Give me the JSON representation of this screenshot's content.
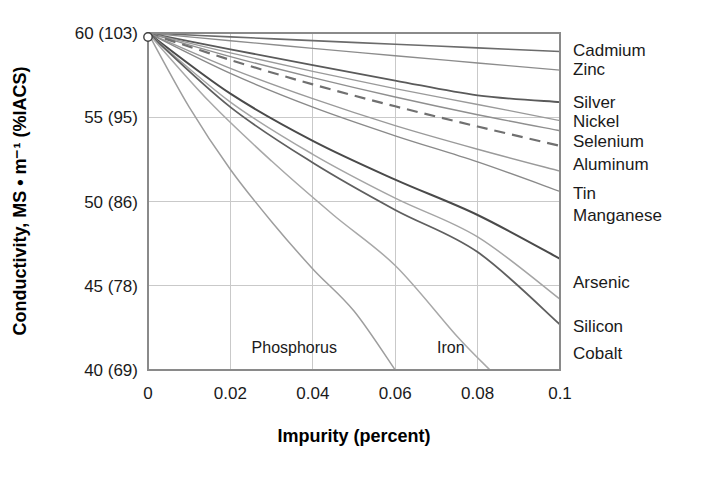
{
  "chart_data": {
    "type": "line",
    "title": "",
    "xlabel": "Impurity (percent)",
    "ylabel": "Conductivity, MS • m⁻¹ (%IACS)",
    "xlim": [
      0,
      0.1
    ],
    "ylim": [
      40,
      60
    ],
    "grid": true,
    "legend_position": "right-of-plot (inline end-of-line labels)",
    "x_ticks": [
      {
        "value": 0,
        "label": "0"
      },
      {
        "value": 0.02,
        "label": "0.02"
      },
      {
        "value": 0.04,
        "label": "0.04"
      },
      {
        "value": 0.06,
        "label": "0.06"
      },
      {
        "value": 0.08,
        "label": "0.08"
      },
      {
        "value": 0.1,
        "label": "0.1"
      }
    ],
    "y_ticks": [
      {
        "value": 60,
        "label": "60 (103)"
      },
      {
        "value": 55,
        "label": "55 (95)"
      },
      {
        "value": 50,
        "label": "50 (86)"
      },
      {
        "value": 45,
        "label": "45 (78)"
      },
      {
        "value": 40,
        "label": "40 (69)"
      }
    ],
    "origin_marker": {
      "x": 0,
      "y": 60
    },
    "annotations": [
      {
        "text": "Phosphorus",
        "x": 0.0355,
        "y": 41.0
      },
      {
        "text": "Iron",
        "x": 0.0735,
        "y": 41.0
      }
    ],
    "series": [
      {
        "name": "Cadmium",
        "label": "Cadmium",
        "color": "#6b6b6b",
        "width": 1.6,
        "dashed": false,
        "x": [
          0,
          0.02,
          0.04,
          0.06,
          0.08,
          0.1
        ],
        "values": [
          60,
          59.77,
          59.55,
          59.33,
          59.12,
          58.9
        ]
      },
      {
        "name": "Zinc",
        "label": "Zinc",
        "color": "#8c8c8c",
        "width": 1.3,
        "dashed": false,
        "x": [
          0,
          0.02,
          0.04,
          0.06,
          0.08,
          0.1
        ],
        "values": [
          60,
          59.54,
          59.09,
          58.65,
          58.22,
          57.8
        ]
      },
      {
        "name": "Silver",
        "label": "Silver",
        "color": "#5a5a5a",
        "width": 1.8,
        "dashed": false,
        "x": [
          0,
          0.02,
          0.04,
          0.06,
          0.08,
          0.1
        ],
        "values": [
          60,
          59.03,
          58.09,
          57.18,
          56.3,
          55.9
        ]
      },
      {
        "name": "Nickel",
        "label": "Nickel",
        "color": "#9a9a9a",
        "width": 1.4,
        "dashed": false,
        "x": [
          0,
          0.02,
          0.04,
          0.06,
          0.08,
          0.1
        ],
        "values": [
          60,
          58.82,
          57.72,
          56.7,
          55.76,
          54.8
        ]
      },
      {
        "name": "Selenium",
        "label": "Selenium",
        "color": "#8f8f8f",
        "width": 1.4,
        "dashed": false,
        "x": [
          0,
          0.02,
          0.04,
          0.06,
          0.08,
          0.1
        ],
        "values": [
          60,
          58.6,
          57.35,
          56.2,
          55.15,
          54.2
        ]
      },
      {
        "name": "Aluminum",
        "label": "Aluminum",
        "color": "#707070",
        "width": 2.2,
        "dashed": true,
        "x": [
          0,
          0.02,
          0.04,
          0.06,
          0.08,
          0.1
        ],
        "values": [
          60,
          58.4,
          56.95,
          55.65,
          54.45,
          53.3
        ]
      },
      {
        "name": "Tin",
        "label": "Tin",
        "color": "#9a9a9a",
        "width": 1.4,
        "dashed": false,
        "x": [
          0,
          0.02,
          0.04,
          0.06,
          0.08,
          0.1
        ],
        "values": [
          60,
          57.9,
          56.1,
          54.5,
          53.1,
          51.8
        ]
      },
      {
        "name": "Manganese",
        "label": "Manganese",
        "color": "#8a8a8a",
        "width": 1.4,
        "dashed": false,
        "x": [
          0,
          0.02,
          0.04,
          0.06,
          0.08,
          0.1
        ],
        "values": [
          60,
          57.6,
          55.6,
          53.9,
          52.35,
          50.6
        ]
      },
      {
        "name": "Arsenic",
        "label": "Arsenic",
        "color": "#4a4a4a",
        "width": 2.0,
        "dashed": false,
        "x": [
          0,
          0.02,
          0.04,
          0.06,
          0.08,
          0.1
        ],
        "values": [
          60,
          56.4,
          53.6,
          51.3,
          49.2,
          46.6
        ]
      },
      {
        "name": "Silicon",
        "label": "Silicon",
        "color": "#a5a5a5",
        "width": 1.5,
        "dashed": false,
        "x": [
          0,
          0.02,
          0.04,
          0.06,
          0.08,
          0.1
        ],
        "values": [
          60,
          55.9,
          52.8,
          50.2,
          47.9,
          44.2
        ]
      },
      {
        "name": "Cobalt",
        "label": "Cobalt",
        "color": "#5f5f5f",
        "width": 1.8,
        "dashed": false,
        "x": [
          0,
          0.02,
          0.04,
          0.06,
          0.08,
          0.1
        ],
        "values": [
          60,
          55.6,
          52.3,
          49.5,
          47.0,
          42.7
        ]
      },
      {
        "name": "Phosphorus",
        "label": "Phosphorus",
        "color": "#9e9e9e",
        "width": 1.5,
        "dashed": false,
        "x": [
          0,
          0.01,
          0.02,
          0.03,
          0.04,
          0.05,
          0.06
        ],
        "values": [
          60,
          55.6,
          51.9,
          48.8,
          46.0,
          43.5,
          40.0
        ]
      },
      {
        "name": "Iron",
        "label": "Iron",
        "color": "#a8a8a8",
        "width": 1.5,
        "dashed": false,
        "x": [
          0,
          0.015,
          0.03,
          0.045,
          0.06,
          0.075,
          0.083
        ],
        "values": [
          60,
          55.9,
          52.4,
          49.2,
          46.2,
          42.0,
          40.0
        ]
      }
    ],
    "right_labels": [
      {
        "text": "Cadmium",
        "y": 59.0
      },
      {
        "text": "Zinc",
        "y": 57.85
      },
      {
        "text": "Silver",
        "y": 55.9
      },
      {
        "text": "Nickel",
        "y": 54.75
      },
      {
        "text": "Selenium",
        "y": 53.6
      },
      {
        "text": "Aluminum",
        "y": 52.2
      },
      {
        "text": "Tin",
        "y": 50.5
      },
      {
        "text": "Manganese",
        "y": 49.2
      },
      {
        "text": "Arsenic",
        "y": 45.2
      },
      {
        "text": "Silicon",
        "y": 42.6
      },
      {
        "text": "Cobalt",
        "y": 41.0
      }
    ]
  }
}
